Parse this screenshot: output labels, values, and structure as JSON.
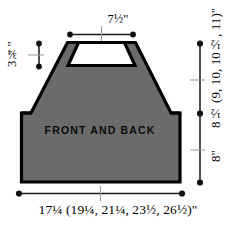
{
  "diagram": {
    "kind": "garment-schematic",
    "piece_caption": "FRONT AND BACK",
    "colors": {
      "fill": "#6b6b6b",
      "outline": "#000000",
      "background": "#ffffff",
      "dimension_line": "#1a1a1a"
    },
    "dimensions": {
      "top_neck_width": "7½\"",
      "left_neck_depth": "3¾\"",
      "right_upper_height": "8½ (9, 10, 10½, 11)\"",
      "right_lower_height": "8\"",
      "bottom_width": "17¼ (19¼, 21¼, 23½, 26½)\""
    },
    "dimension_lines": [
      {
        "name": "top-shoulder-width",
        "orientation": "horizontal"
      },
      {
        "name": "neck-depth",
        "orientation": "vertical"
      },
      {
        "name": "armhole-to-shoulder",
        "orientation": "vertical"
      },
      {
        "name": "body-length",
        "orientation": "vertical"
      },
      {
        "name": "hem-width",
        "orientation": "horizontal"
      }
    ]
  }
}
